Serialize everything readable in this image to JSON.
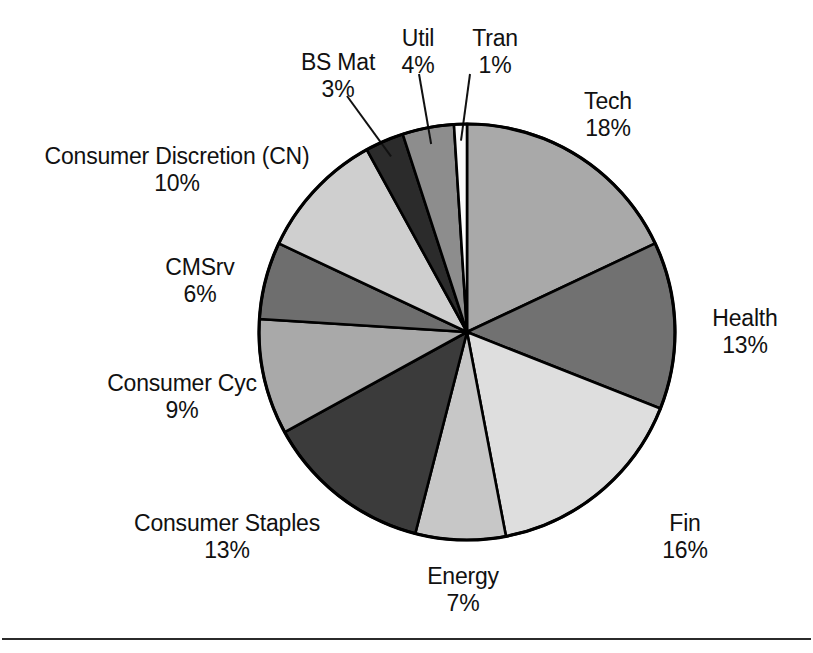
{
  "chart_data": {
    "type": "pie",
    "title": "",
    "subtitle": "",
    "xlabel": "",
    "ylabel": "",
    "legend_position": "none",
    "grid": false,
    "units": "percent",
    "start_angle_deg": 0,
    "direction": "clockwise",
    "total": 100,
    "categories": [
      "Tech",
      "Health",
      "Fin",
      "Energy",
      "Consumer Staples",
      "Consumer Cyc",
      "CMSrv",
      "Consumer Discretion (CN)",
      "BS Mat",
      "Util",
      "Tran"
    ],
    "values": [
      18,
      13,
      16,
      7,
      13,
      9,
      6,
      10,
      3,
      4,
      1
    ],
    "value_labels": [
      "18%",
      "13%",
      "16%",
      "7%",
      "13%",
      "9%",
      "6%",
      "10%",
      "3%",
      "4%",
      "1%"
    ],
    "colors": [
      "#a9a9a9",
      "#717171",
      "#dedede",
      "#c7c7c7",
      "#3b3b3b",
      "#a9a9a9",
      "#6e6e6e",
      "#cfcfcf",
      "#2b2b2b",
      "#8d8d8d",
      "#fbfbfb"
    ],
    "slices": [
      {
        "name": "Tech",
        "value": 18,
        "value_label": "18%",
        "color": "#a9a9a9",
        "leader_line": false
      },
      {
        "name": "Health",
        "value": 13,
        "value_label": "13%",
        "color": "#717171",
        "leader_line": false
      },
      {
        "name": "Fin",
        "value": 16,
        "value_label": "16%",
        "color": "#dedede",
        "leader_line": false
      },
      {
        "name": "Energy",
        "value": 7,
        "value_label": "7%",
        "color": "#c7c7c7",
        "leader_line": false
      },
      {
        "name": "Consumer Staples",
        "value": 13,
        "value_label": "13%",
        "color": "#3b3b3b",
        "leader_line": false
      },
      {
        "name": "Consumer Cyc",
        "value": 9,
        "value_label": "9%",
        "color": "#a9a9a9",
        "leader_line": false
      },
      {
        "name": "CMSrv",
        "value": 6,
        "value_label": "6%",
        "color": "#6e6e6e",
        "leader_line": false
      },
      {
        "name": "Consumer Discretion (CN)",
        "value": 10,
        "value_label": "10%",
        "color": "#cfcfcf",
        "leader_line": false
      },
      {
        "name": "BS Mat",
        "value": 3,
        "value_label": "3%",
        "color": "#2b2b2b",
        "leader_line": true
      },
      {
        "name": "Util",
        "value": 4,
        "value_label": "4%",
        "color": "#8d8d8d",
        "leader_line": true
      },
      {
        "name": "Tran",
        "value": 1,
        "value_label": "1%",
        "color": "#fbfbfb",
        "leader_line": true
      }
    ]
  },
  "labels": {
    "tech": {
      "name": "Tech",
      "value": "18%"
    },
    "health": {
      "name": "Health",
      "value": "13%"
    },
    "fin": {
      "name": "Fin",
      "value": "16%"
    },
    "energy": {
      "name": "Energy",
      "value": "7%"
    },
    "staples": {
      "name": "Consumer Staples",
      "value": "13%"
    },
    "cyc": {
      "name": "Consumer Cyc",
      "value": "9%"
    },
    "cmsrv": {
      "name": "CMSrv",
      "value": "6%"
    },
    "discretion": {
      "name": "Consumer Discretion (CN)",
      "value": "10%"
    },
    "bsmat": {
      "name": "BS Mat",
      "value": "3%"
    },
    "util": {
      "name": "Util",
      "value": "4%"
    },
    "tran": {
      "name": "Tran",
      "value": "1%"
    }
  },
  "style": {
    "background": "#ffffff",
    "outline": "#000000",
    "text": "#111111",
    "rule": "#2b2b2b"
  }
}
